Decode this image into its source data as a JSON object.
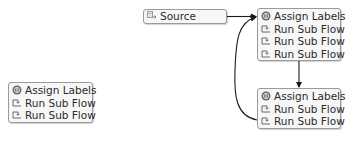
{
  "diagram": {
    "colors": {
      "node_fill": "#f7f7f7",
      "node_border": "#9a9a9a",
      "connector": "#1a1a1a",
      "text": "#2a2a2a"
    },
    "nodes": [
      {
        "id": "source",
        "rows": [
          {
            "icon": "source-icon",
            "label": "Source"
          }
        ]
      },
      {
        "id": "group-top",
        "rows": [
          {
            "icon": "assign-labels-icon",
            "label": "Assign Labels"
          },
          {
            "icon": "run-sub-flow-icon",
            "label": "Run Sub Flow"
          },
          {
            "icon": "run-sub-flow-icon",
            "label": "Run Sub Flow"
          },
          {
            "icon": "run-sub-flow-icon",
            "label": "Run Sub Flow"
          }
        ]
      },
      {
        "id": "group-bottom",
        "rows": [
          {
            "icon": "assign-labels-icon",
            "label": "Assign Labels"
          },
          {
            "icon": "run-sub-flow-icon",
            "label": "Run Sub Flow"
          },
          {
            "icon": "run-sub-flow-icon",
            "label": "Run Sub Flow"
          }
        ]
      },
      {
        "id": "group-left",
        "rows": [
          {
            "icon": "assign-labels-icon",
            "label": "Assign Labels"
          },
          {
            "icon": "run-sub-flow-icon",
            "label": "Run Sub Flow"
          },
          {
            "icon": "run-sub-flow-icon",
            "label": "Run Sub Flow"
          }
        ]
      }
    ],
    "edges": [
      {
        "from": "source",
        "to": "group-top",
        "style": "straight"
      },
      {
        "from": "group-top",
        "to": "group-bottom",
        "style": "straight-vertical"
      },
      {
        "from": "group-bottom",
        "to": "group-top",
        "style": "curved-loop"
      }
    ]
  }
}
